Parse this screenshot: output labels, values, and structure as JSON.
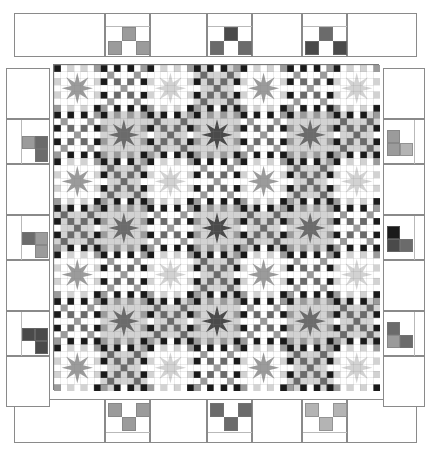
{
  "figure": {
    "kind": "quilt-pattern-diagram",
    "width": 431,
    "height": 450,
    "background": "#ffffff"
  },
  "palette": {
    "white": "#ffffff",
    "light_gray": "#d2d2d2",
    "medium_gray": "#9b9b9b",
    "dark_gray": "#6b6b6b",
    "charcoal": "#4a4a4a",
    "black": "#1a1a1a",
    "outline": "#8a8a8a"
  },
  "quilt": {
    "x": 53,
    "y": 64,
    "size": 326,
    "grid_blocks": 7,
    "block_px": 46.571,
    "cells_per_block": 7,
    "cell_px": 6.653,
    "block_types": [
      "star",
      "chain"
    ],
    "layout_note": "checkerboard alternation: star blocks where (row+col) is even, chain blocks where odd",
    "star_grounds": [
      "white",
      "light_gray"
    ],
    "star_colors": [
      "medium_gray",
      "dark_gray",
      "charcoal",
      "light_gray"
    ]
  },
  "borders": {
    "top": {
      "y": 13,
      "height": 44,
      "tiles": [
        {
          "x": 14,
          "w": 91,
          "motif": null
        },
        {
          "x": 105,
          "w": 45,
          "motif": "three-patch-up",
          "colors": [
            "#9b9b9b",
            "#9b9b9b",
            "#9b9b9b"
          ]
        },
        {
          "x": 150,
          "w": 57,
          "motif": null
        },
        {
          "x": 207,
          "w": 45,
          "motif": "three-patch-up",
          "colors": [
            "#4a4a4a",
            "#6b6b6b",
            "#6b6b6b"
          ]
        },
        {
          "x": 252,
          "w": 50,
          "motif": null
        },
        {
          "x": 302,
          "w": 45,
          "motif": "three-patch-up",
          "colors": [
            "#6b6b6b",
            "#4a4a4a",
            "#4a4a4a"
          ]
        },
        {
          "x": 347,
          "w": 70,
          "motif": null
        }
      ]
    },
    "bottom": {
      "y": 399,
      "height": 44,
      "tiles": [
        {
          "x": 14,
          "w": 91,
          "motif": null
        },
        {
          "x": 105,
          "w": 45,
          "motif": "three-patch-down",
          "colors": [
            "#9b9b9b",
            "#9b9b9b",
            "#9b9b9b"
          ]
        },
        {
          "x": 150,
          "w": 57,
          "motif": null
        },
        {
          "x": 207,
          "w": 45,
          "motif": "three-patch-down",
          "colors": [
            "#6b6b6b",
            "#6b6b6b",
            "#6b6b6b"
          ]
        },
        {
          "x": 252,
          "w": 50,
          "motif": null
        },
        {
          "x": 302,
          "w": 45,
          "motif": "three-patch-down",
          "colors": [
            "#b4b4b4",
            "#b4b4b4",
            "#b4b4b4"
          ]
        },
        {
          "x": 347,
          "w": 70,
          "motif": null
        }
      ]
    },
    "left": {
      "x": 6,
      "width": 44,
      "tiles": [
        {
          "y": 68,
          "h": 51,
          "motif": null
        },
        {
          "y": 119,
          "h": 45,
          "motif": "three-patch-right",
          "colors": [
            "#6b6b6b",
            "#9b9b9b",
            "#6b6b6b"
          ]
        },
        {
          "y": 164,
          "h": 51,
          "motif": null
        },
        {
          "y": 215,
          "h": 45,
          "motif": "three-patch-right",
          "colors": [
            "#9b9b9b",
            "#6b6b6b",
            "#9b9b9b"
          ]
        },
        {
          "y": 260,
          "h": 51,
          "motif": null
        },
        {
          "y": 311,
          "h": 45,
          "motif": "three-patch-right",
          "colors": [
            "#4a4a4a",
            "#4a4a4a",
            "#4a4a4a"
          ]
        },
        {
          "y": 356,
          "h": 51,
          "motif": null
        }
      ]
    },
    "right": {
      "x": 383,
      "width": 42,
      "tiles": [
        {
          "y": 68,
          "h": 51,
          "motif": null
        },
        {
          "y": 119,
          "h": 45,
          "motif": "three-patch-left",
          "colors": [
            "#9b9b9b",
            "#b4b4b4",
            "#9b9b9b"
          ]
        },
        {
          "y": 164,
          "h": 51,
          "motif": null
        },
        {
          "y": 215,
          "h": 45,
          "motif": "three-patch-left",
          "colors": [
            "#1a1a1a",
            "#6b6b6b",
            "#4a4a4a"
          ]
        },
        {
          "y": 260,
          "h": 51,
          "motif": null
        },
        {
          "y": 311,
          "h": 45,
          "motif": "three-patch-left",
          "colors": [
            "#6b6b6b",
            "#6b6b6b",
            "#9b9b9b"
          ]
        },
        {
          "y": 356,
          "h": 51,
          "motif": null
        }
      ]
    }
  },
  "chart_data": {
    "type": "heatmap",
    "xlabel": "",
    "ylabel": "",
    "categories": [
      "col1",
      "col2",
      "col3",
      "col4",
      "col5",
      "col6",
      "col7"
    ],
    "rows": [
      "row1",
      "row2",
      "row3",
      "row4",
      "row5",
      "row6",
      "row7"
    ],
    "series": [
      {
        "name": "row1",
        "values": [
          "star",
          "chain",
          "star",
          "chain",
          "star",
          "chain",
          "star"
        ]
      },
      {
        "name": "row2",
        "values": [
          "chain",
          "star",
          "chain",
          "star",
          "chain",
          "star",
          "chain"
        ]
      },
      {
        "name": "row3",
        "values": [
          "star",
          "chain",
          "star",
          "chain",
          "star",
          "chain",
          "star"
        ]
      },
      {
        "name": "row4",
        "values": [
          "chain",
          "star",
          "chain",
          "star",
          "chain",
          "star",
          "chain"
        ]
      },
      {
        "name": "row5",
        "values": [
          "star",
          "chain",
          "star",
          "chain",
          "star",
          "chain",
          "star"
        ]
      },
      {
        "name": "row6",
        "values": [
          "chain",
          "star",
          "chain",
          "star",
          "chain",
          "star",
          "chain"
        ]
      },
      {
        "name": "row7",
        "values": [
          "star",
          "chain",
          "star",
          "chain",
          "star",
          "chain",
          "star"
        ]
      }
    ],
    "legend": [
      "star block",
      "chain block"
    ],
    "grid": false
  }
}
